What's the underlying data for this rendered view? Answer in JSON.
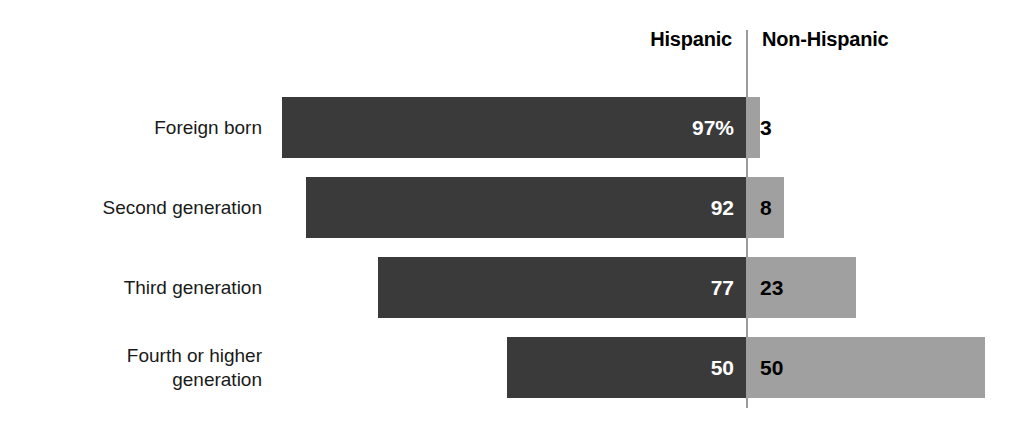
{
  "header": {
    "primary_label": "Hispanic",
    "secondary_label": "Non-Hispanic"
  },
  "colors": {
    "primary_bar": "#3a3a3a",
    "secondary_bar": "#a0a0a0",
    "primary_value_text": "#ffffff",
    "secondary_value_text": "#000000",
    "divider": "#9a9a9a",
    "background": "#ffffff"
  },
  "rows": [
    {
      "label_line1": "Foreign born",
      "label_line2": "",
      "primary_value": 97,
      "secondary_value": 3,
      "primary_display": "97%",
      "secondary_display": "3"
    },
    {
      "label_line1": "Second generation",
      "label_line2": "",
      "primary_value": 92,
      "secondary_value": 8,
      "primary_display": "92",
      "secondary_display": "8"
    },
    {
      "label_line1": "Third generation",
      "label_line2": "",
      "primary_value": 77,
      "secondary_value": 23,
      "primary_display": "77",
      "secondary_display": "23"
    },
    {
      "label_line1": "Fourth or higher",
      "label_line2": "generation",
      "primary_value": 50,
      "secondary_value": 50,
      "primary_display": "50",
      "secondary_display": "50"
    }
  ],
  "chart_data": {
    "type": "bar",
    "subtype": "stacked-horizontal-100pct-diverging",
    "title": "",
    "xlabel": "",
    "ylabel": "",
    "categories": [
      "Foreign born",
      "Second generation",
      "Third generation",
      "Fourth or higher generation"
    ],
    "series": [
      {
        "name": "Hispanic",
        "values": [
          97,
          92,
          77,
          50
        ],
        "color": "#3a3a3a",
        "data_labels": [
          "97%",
          "92",
          "77",
          "50"
        ]
      },
      {
        "name": "Non-Hispanic",
        "values": [
          3,
          8,
          23,
          50
        ],
        "color": "#a0a0a0",
        "data_labels": [
          "3",
          "8",
          "23",
          "50"
        ]
      }
    ],
    "units": "percent",
    "xlim": [
      0,
      100
    ],
    "grid": false,
    "legend": "top",
    "legend_entries": [
      "Hispanic",
      "Non-Hispanic"
    ]
  }
}
